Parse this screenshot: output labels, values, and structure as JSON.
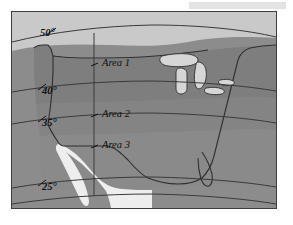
{
  "figure": {
    "kind": "map",
    "region": "United States",
    "projection_note": "curved latitude lines with one vertical meridian"
  },
  "map": {
    "latitude_labels": [
      {
        "id": "lat-50",
        "text": "50°",
        "value": 50,
        "x": 39,
        "y": 21
      },
      {
        "id": "lat-40",
        "text": "40°",
        "value": 40,
        "x": 41,
        "y": 79
      },
      {
        "id": "lat-35",
        "text": "35°",
        "value": 35,
        "x": 41,
        "y": 111
      },
      {
        "id": "lat-25",
        "text": "25°",
        "value": 25,
        "x": 41,
        "y": 175
      }
    ],
    "area_labels": [
      {
        "id": "area-1",
        "text": "Area 1",
        "x": 104,
        "y": 62
      },
      {
        "id": "area-2",
        "text": "Area 2",
        "x": 104,
        "y": 113
      },
      {
        "id": "area-3",
        "text": "Area 3",
        "x": 104,
        "y": 144
      }
    ],
    "colors": {
      "ocean_background": "#8c8c8c",
      "united_states_band1": "#7e7e7e",
      "united_states_band2": "#848484",
      "united_states_band3": "#8a8a8a",
      "canada": "#c9c9c9",
      "mexico": "#eeeeee",
      "lakes": "#d6d6d6",
      "coastline": "#2f2f2f",
      "graticule": "#3a3a3a",
      "frame_border": "#3d3d3d",
      "page_background": "#ffffff",
      "scan_artifact": "#e3e3e3"
    }
  }
}
